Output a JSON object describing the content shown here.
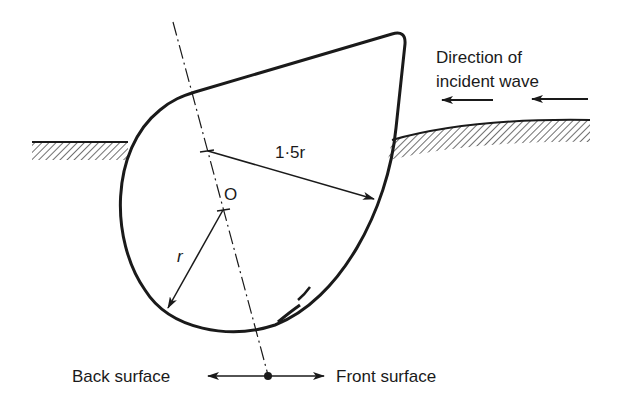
{
  "labels": {
    "direction_line1": "Direction of",
    "direction_line2": "incident wave",
    "radius_large": "1·5r",
    "origin": "O",
    "radius_small": "r",
    "back_surface": "Back surface",
    "front_surface": "Front surface"
  },
  "colors": {
    "ink": "#1a1a1a",
    "background": "#ffffff"
  }
}
